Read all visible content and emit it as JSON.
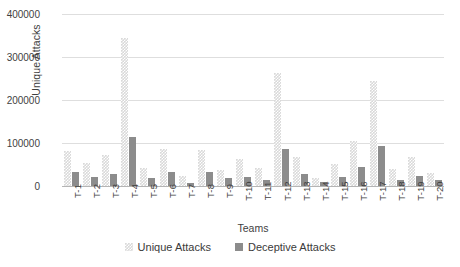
{
  "chart_data": {
    "type": "bar",
    "title": "",
    "xlabel": "Teams",
    "ylabel": "Unique Attacks",
    "ylim": [
      0,
      400000
    ],
    "yticks": [
      0,
      100000,
      200000,
      300000,
      400000
    ],
    "ytick_labels": [
      "0",
      "100000",
      "200000",
      "300000",
      "400000"
    ],
    "grid": true,
    "legend_position": "bottom",
    "categories": [
      "T-1",
      "T-2",
      "T-3",
      "T-4",
      "T-5",
      "T-6",
      "T-7",
      "T-8",
      "T-9",
      "T-10",
      "T-11",
      "T-12",
      "T-13",
      "T-14",
      "T-15",
      "T-16",
      "T-17",
      "T-18",
      "T-19",
      "T-20"
    ],
    "series": [
      {
        "name": "Unique Attacks",
        "color": "#d9d9d9",
        "values": [
          82000,
          53000,
          73000,
          345000,
          42000,
          85000,
          23000,
          84000,
          37000,
          62000,
          43000,
          262000,
          68000,
          18000,
          52000,
          105000,
          245000,
          40000,
          68000,
          30000
        ]
      },
      {
        "name": "Deceptive Attacks",
        "color": "#8c8c8c",
        "values": [
          33000,
          22000,
          27000,
          115000,
          18000,
          33000,
          8000,
          33000,
          18000,
          22000,
          14000,
          85000,
          28000,
          10000,
          20000,
          44000,
          92000,
          14000,
          23000,
          13000
        ]
      }
    ]
  },
  "legend": {
    "entries": [
      {
        "label": "Unique Attacks"
      },
      {
        "label": "Deceptive Attacks"
      }
    ]
  }
}
